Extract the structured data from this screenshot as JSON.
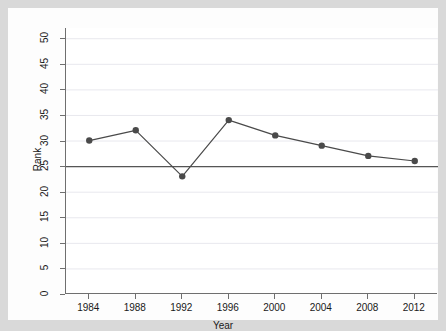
{
  "chart_data": {
    "type": "line",
    "title": "",
    "subtitle": "",
    "xlabel": "Year",
    "ylabel": "Rank",
    "x": [
      1984,
      1988,
      1992,
      1996,
      2000,
      2004,
      2008,
      2012
    ],
    "categories": [
      "1984",
      "1988",
      "1992",
      "1996",
      "2000",
      "2004",
      "2008",
      "2012"
    ],
    "series": [
      {
        "name": "Rank",
        "values": [
          30,
          32,
          23,
          34,
          31,
          29,
          27,
          26
        ],
        "marker": "filled-circle",
        "color": "#4a4a4a"
      }
    ],
    "reference_lines": [
      {
        "axis": "y",
        "value": 25,
        "color": "#555555"
      }
    ],
    "xlim": [
      1982,
      2014
    ],
    "ylim": [
      0,
      52
    ],
    "ytick_labels": [
      "0",
      "5",
      "10",
      "15",
      "20",
      "25",
      "30",
      "35",
      "40",
      "45",
      "50"
    ],
    "ytick_values": [
      0,
      5,
      10,
      15,
      20,
      25,
      30,
      35,
      40,
      45,
      50
    ],
    "xtick_labels": [
      "1984",
      "1988",
      "1992",
      "1996",
      "2000",
      "2004",
      "2008",
      "2012"
    ],
    "grid": "horizontal",
    "grid_color": "#e8e8ee",
    "legend": "none",
    "legend_position": "none",
    "plot_background": "#ffffff",
    "figure_background": "#d9d9d9",
    "axis_color": "#6f6f6f",
    "text_color": "#1a1a1a"
  }
}
